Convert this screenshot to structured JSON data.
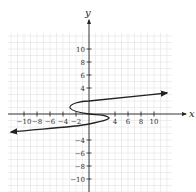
{
  "chart_data": {
    "type": "line",
    "title": "",
    "xlabel": "x",
    "ylabel": "y",
    "xlim": [
      -12,
      12
    ],
    "ylim": [
      -12,
      12
    ],
    "grid": true,
    "x_ticks": [
      -10,
      -8,
      -6,
      -4,
      -2,
      4,
      6,
      8,
      10
    ],
    "y_ticks": [
      10,
      8,
      6,
      4,
      -4,
      -6,
      -8,
      -10
    ],
    "x_tick_labels": [
      "−10",
      "−8",
      "−6",
      "−4",
      "−2",
      "4",
      "6",
      "8",
      "10"
    ],
    "y_tick_labels": [
      "10",
      "8",
      "6",
      "4",
      "−4",
      "−6",
      "−8",
      "−10"
    ],
    "series": [
      {
        "name": "curve",
        "description": "S-shaped cubic curve in x as function of y (x = y^3 - 4y like), arrows at both ends",
        "points": [
          {
            "x": -12,
            "y": -2.8
          },
          {
            "x": -2,
            "y": -2.2
          },
          {
            "x": 0,
            "y": -1.6
          },
          {
            "x": 3,
            "y": -0.9
          },
          {
            "x": 0,
            "y": 0
          },
          {
            "x": -3,
            "y": 0.9
          },
          {
            "x": 0,
            "y": 1.9
          },
          {
            "x": 4,
            "y": 2.3
          },
          {
            "x": 12,
            "y": 3.1
          }
        ]
      }
    ]
  },
  "axes": {
    "x_label": "x",
    "y_label": "y"
  }
}
